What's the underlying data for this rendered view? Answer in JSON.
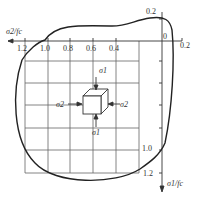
{
  "diagram": {
    "type": "biaxial strength envelope",
    "x_axis": {
      "label": "σ2/fc",
      "ticks": [
        "1.2",
        "1.0",
        "0.8",
        "0.6",
        "0.4",
        "0",
        "0.2"
      ]
    },
    "y_axis": {
      "label": "σ1/fc",
      "ticks": [
        "0.2",
        "1.0",
        "1.2"
      ]
    },
    "element": {
      "stress_labels": {
        "top": "σ1",
        "bottom": "σ1",
        "left": "σ2",
        "right": "σ2"
      }
    },
    "colors": {
      "line": "#222222",
      "grid": "#555555"
    }
  }
}
